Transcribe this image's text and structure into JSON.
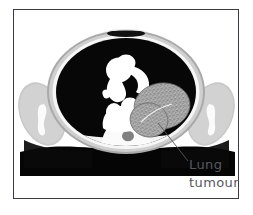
{
  "figure": {
    "kind": "medical-illustration",
    "modality": "CT",
    "view": "axial-chest-cross-section",
    "frame_border_color": "#3a3a42",
    "background_color": "#ffffff"
  },
  "annotation": {
    "line1": "Lung",
    "line2": "tumour",
    "text_color": "#58585e",
    "leader_line_color": "#55555c"
  },
  "anatomy": {
    "body_wall_color": "#b9b9b9",
    "subcutaneous_color": "#d6d6d6",
    "inner_rim_color": "#f4f4f4",
    "lung_field_color": "#070707",
    "mediastinum_color": "#ffffff",
    "bone_color": "#fdfdfd",
    "tumour_color": "#9a9a9a",
    "table_color": "#050505",
    "parts": [
      {
        "name": "chest-wall-outline",
        "label": "Chest wall"
      },
      {
        "name": "left-lung-field",
        "label": "Left lung field"
      },
      {
        "name": "right-lung-field",
        "label": "Right lung field"
      },
      {
        "name": "mediastinum",
        "label": "Mediastinum / great vessels"
      },
      {
        "name": "heart-silhouette",
        "label": "Heart"
      },
      {
        "name": "vertebral-body",
        "label": "Vertebral body"
      },
      {
        "name": "spinal-canal",
        "label": "Spinal canal"
      },
      {
        "name": "sternum-notch",
        "label": "Sternum"
      },
      {
        "name": "left-arm",
        "label": "Left arm"
      },
      {
        "name": "right-arm",
        "label": "Right arm"
      },
      {
        "name": "left-humerus",
        "label": "Left humerus"
      },
      {
        "name": "right-humerus",
        "label": "Right humerus"
      },
      {
        "name": "lung-tumour-mass",
        "label": "Lung tumour"
      },
      {
        "name": "scanner-table",
        "label": "Scanner table"
      }
    ]
  }
}
